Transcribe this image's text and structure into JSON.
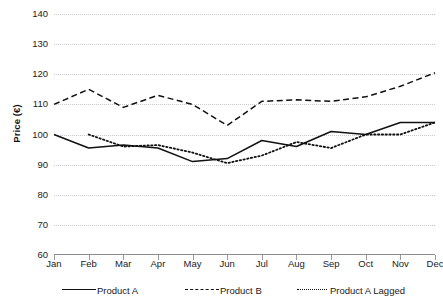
{
  "chart_data": {
    "type": "line",
    "title": "",
    "xlabel": "",
    "ylabel": "Price (€)",
    "categories": [
      "Jan",
      "Feb",
      "Mar",
      "Apr",
      "May",
      "Jun",
      "Jul",
      "Aug",
      "Sep",
      "Oct",
      "Nov",
      "Dec"
    ],
    "ylim": [
      60,
      140
    ],
    "ytick_step": 10,
    "yticks": [
      140,
      130,
      120,
      110,
      100,
      90,
      80,
      70,
      60
    ],
    "grid": "horizontal-dotted",
    "legend_position": "bottom",
    "series": [
      {
        "name": "Product A",
        "style": "solid",
        "color": "#111111",
        "values": [
          100,
          95.5,
          96.5,
          95.5,
          91,
          92,
          98,
          96,
          101,
          100,
          104,
          104
        ]
      },
      {
        "name": "Product B",
        "style": "dashed",
        "color": "#111111",
        "values": [
          110,
          115,
          109,
          113,
          110,
          103,
          111,
          111.5,
          111,
          112.5,
          116,
          120.5
        ]
      },
      {
        "name": "Product A Lagged",
        "style": "dotted",
        "color": "#111111",
        "values": [
          null,
          100,
          96,
          96.5,
          94,
          90.5,
          93,
          97.5,
          95.5,
          100,
          100,
          104
        ]
      }
    ]
  },
  "axis": {
    "y_title": "Price (€)",
    "y_labels": [
      "140",
      "130",
      "120",
      "110",
      "100",
      "90",
      "80",
      "70",
      "60"
    ],
    "x_labels": [
      "Jan",
      "Feb",
      "Mar",
      "Apr",
      "May",
      "Jun",
      "Jul",
      "Aug",
      "Sep",
      "Oct",
      "Nov",
      "Dec"
    ]
  },
  "legend": {
    "items": [
      {
        "label": "Product A",
        "key": "solid-line-key"
      },
      {
        "label": "Product B",
        "key": "dashed-line-key"
      },
      {
        "label": "Product A Lagged",
        "key": "dotted-line-key"
      }
    ]
  },
  "artifact": {
    "top_clipped_text": ""
  }
}
